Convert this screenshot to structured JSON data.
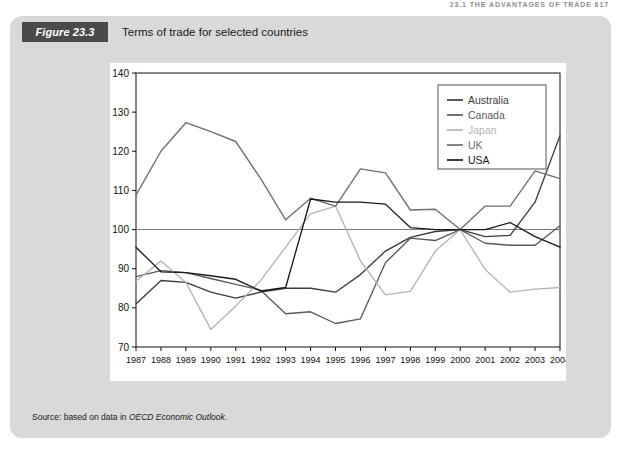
{
  "running_head": "23.1  THE ADVANTAGES OF TRADE   617",
  "figure": {
    "badge": "Figure 23.3",
    "title": "Terms of trade for selected countries",
    "source_prefix": "Source: based on data in ",
    "source_italic": "OECD Economic Outlook",
    "source_suffix": "."
  },
  "colors": {
    "panel_bg": "#d9d9d9",
    "badge_bg": "#4a4a4a",
    "plot_bg": "#ffffff",
    "axis": "#111111",
    "australia": "#3c3c3c",
    "canada": "#5a5a5a",
    "japan": "#b4b4b4",
    "uk": "#6e6e6e",
    "usa": "#1a1a1a"
  },
  "chart_data": {
    "type": "line",
    "title": "Terms of trade for selected countries",
    "xlabel": "",
    "ylabel": "Terms of trade (2000 = 100)",
    "xlim": [
      1987,
      2004
    ],
    "ylim": [
      70,
      140
    ],
    "yticks": [
      70,
      80,
      90,
      100,
      110,
      120,
      130,
      140
    ],
    "grid": false,
    "reference_line": 100,
    "legend_position": "top-right",
    "x": [
      1987,
      1988,
      1989,
      1990,
      1991,
      1992,
      1993,
      1994,
      1995,
      1996,
      1997,
      1998,
      1999,
      2000,
      2001,
      2002,
      2003,
      2004
    ],
    "categories": [
      "1987",
      "1988",
      "1989",
      "1990",
      "1991",
      "1992",
      "1993",
      "1994",
      "1995",
      "1996",
      "1997",
      "1998",
      "1999",
      "2000",
      "2001",
      "2002",
      "2003",
      "2004"
    ],
    "series": [
      {
        "name": "Australia",
        "color": "#3c3c3c",
        "values": [
          81.0,
          87.0,
          86.5,
          84.0,
          82.5,
          84.0,
          85.0,
          85.0,
          84.0,
          88.5,
          94.5,
          98.0,
          99.5,
          100.0,
          98.2,
          98.5,
          107.0,
          124.0
        ]
      },
      {
        "name": "Canada",
        "color": "#5a5a5a",
        "values": [
          88.0,
          89.5,
          89.0,
          87.5,
          86.0,
          84.5,
          78.5,
          79.0,
          76.0,
          77.2,
          91.5,
          97.8,
          97.2,
          100.0,
          96.5,
          96.0,
          96.0,
          101.0
        ]
      },
      {
        "name": "Japan",
        "color": "#b4b4b4",
        "values": [
          86.8,
          92.0,
          86.5,
          74.5,
          80.5,
          87.0,
          95.5,
          104.0,
          106.0,
          92.0,
          83.3,
          84.2,
          94.5,
          100.0,
          89.8,
          84.0,
          84.8,
          85.2
        ]
      },
      {
        "name": "UK",
        "color": "#6e6e6e",
        "values": [
          108.8,
          120.0,
          127.3,
          125.0,
          122.5,
          113.0,
          102.5,
          108.0,
          106.0,
          115.5,
          114.5,
          105.0,
          105.2,
          100.0,
          106.0,
          106.0,
          115.0,
          113.0
        ]
      },
      {
        "name": "USA",
        "color": "#1a1a1a",
        "values": [
          95.5,
          89.2,
          89.0,
          88.2,
          87.3,
          84.3,
          85.2,
          107.8,
          107.0,
          107.0,
          106.5,
          100.5,
          100.0,
          100.0,
          100.0,
          101.8,
          98.2,
          95.5
        ]
      }
    ],
    "legend": [
      "Australia",
      "Canada",
      "Japan",
      "UK",
      "USA"
    ]
  }
}
